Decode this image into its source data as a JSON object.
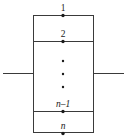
{
  "figure": {
    "kind": "multi-terminal-block-diagram",
    "canvas": {
      "width": 128,
      "height": 139,
      "background": "#ffffff"
    },
    "colors": {
      "line": "#3a3a3a",
      "dot": "#1a1a1a",
      "text": "#1a1a1a",
      "background": "#ffffff"
    },
    "box": {
      "x": 33,
      "y": 15,
      "width": 61,
      "height": 118
    },
    "terminal_x": 63,
    "labels": {
      "terminal_1": "1",
      "terminal_2": "2",
      "terminal_n_minus_1": "n",
      "terminal_n_minus_1_suffix": "–1",
      "terminal_n": "n"
    },
    "terminals": [
      {
        "name": "terminal-1",
        "label": "1",
        "italic": false,
        "line_y": 15,
        "label_y": 11
      },
      {
        "name": "terminal-2",
        "label": "2",
        "italic": false,
        "line_y": 41,
        "label_y": 37
      },
      {
        "name": "terminal-n-minus-1",
        "label": "n–1",
        "italic": true,
        "line_y": 111,
        "label_y": 107
      },
      {
        "name": "terminal-n",
        "label": "n",
        "italic": true,
        "line_y": 133,
        "label_y": 129
      }
    ],
    "divider_lines_y": [
      41,
      111
    ],
    "ellipsis": {
      "x": 63,
      "dots_y": [
        61,
        74,
        87
      ],
      "radius": 1.2,
      "glyph": "⋮"
    },
    "leads": [
      {
        "name": "left-lead",
        "x1": 3,
        "x2": 33,
        "y": 73
      },
      {
        "name": "right-lead",
        "x1": 94,
        "x2": 124,
        "y": 73
      }
    ],
    "dot_radius": 1.7
  }
}
